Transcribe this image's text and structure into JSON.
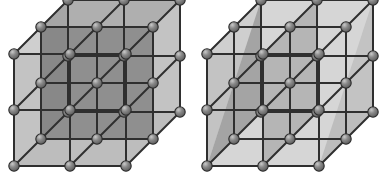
{
  "figure": {
    "background_color": "#ffffff",
    "width": 387,
    "height": 176,
    "panel_count": 2
  },
  "style": {
    "atom_fill": "#8a8a8a",
    "atom_highlight": "#c9c9c9",
    "atom_stroke": "#2b2b2b",
    "atom_radius": 5.2,
    "edge_color": "#2f2f2f",
    "edge_width": 2,
    "face_light": "#c3c3c3",
    "face_mid": "#b0b0b0",
    "face_dark": "#8f8f8f",
    "face_darker": "#848484",
    "plane_highlight": "#d6d6d6",
    "plane_stroke": "#6e6e6e"
  },
  "projection": {
    "type": "oblique",
    "cell_size_px": 56,
    "depth_dx_px": 27,
    "depth_dy_px": -27,
    "cells_per_edge": 2,
    "atoms_per_edge": 3,
    "atoms_total_per_panel": 27
  },
  "panels": [
    {
      "id": "left-cube",
      "name": "cube-with-cube-face-plane",
      "origin": {
        "x": 14,
        "y": 166
      },
      "plane": {
        "label": "(100) type interior plane",
        "orientation": "vertical-axis-parallel",
        "shading": "#8f8f8f"
      },
      "faces": [
        {
          "name": "left-face",
          "shade": "#c3c3c3"
        },
        {
          "name": "top-face",
          "shade": "#cfcfcf"
        },
        {
          "name": "interior-plane",
          "shade": "#8f8f8f"
        },
        {
          "name": "interior-top",
          "shade": "#a8a8a8"
        }
      ]
    },
    {
      "id": "right-cube",
      "name": "cube-with-diagonal-plane",
      "origin": {
        "x": 207,
        "y": 166
      },
      "plane": {
        "label": "(110) type diagonal plane",
        "orientation": "body-diagonal",
        "shading": "#d6d6d6"
      },
      "faces": [
        {
          "name": "left-face",
          "shade": "#c3c3c3"
        },
        {
          "name": "top-face",
          "shade": "#cfcfcf"
        },
        {
          "name": "diagonal-plane",
          "shade": "#d6d6d6"
        },
        {
          "name": "inner-shadow",
          "shade": "#9b9b9b"
        }
      ]
    }
  ],
  "legend": {
    "atom_label": "lattice atom",
    "edge_label": "lattice bond",
    "plane_label": "highlighted crystal plane"
  }
}
